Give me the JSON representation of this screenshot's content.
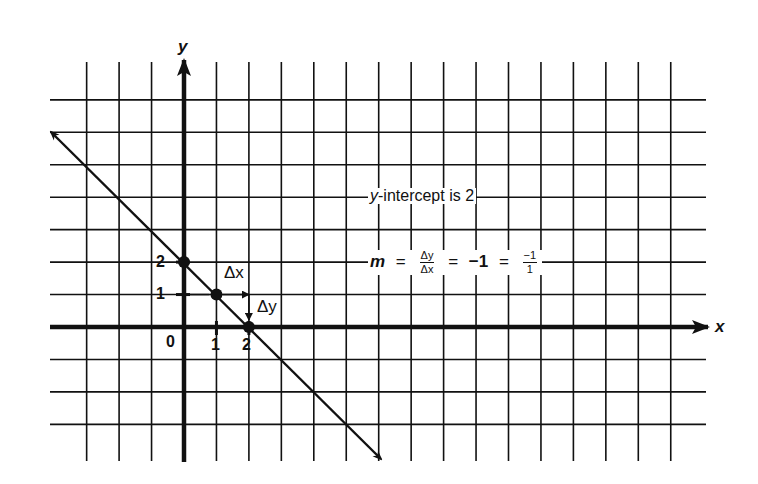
{
  "chart_data": {
    "type": "line",
    "title": "",
    "xlabel": "x",
    "ylabel": "y",
    "xlim": [
      -4,
      16
    ],
    "ylim": [
      -4,
      8
    ],
    "grid": true,
    "origin_label": "0",
    "x_tick_labels": [
      "1",
      "2"
    ],
    "y_tick_labels": [
      "1",
      "2"
    ],
    "series": [
      {
        "name": "y = -x + 2",
        "x": [
          -4,
          6
        ],
        "y": [
          6,
          -4
        ],
        "arrows": "both"
      }
    ],
    "points": [
      {
        "x": 0,
        "y": 2,
        "label": "y-intercept"
      },
      {
        "x": 1,
        "y": 1,
        "label": ""
      },
      {
        "x": 2,
        "y": 0,
        "label": "x-intercept"
      }
    ],
    "annotations": {
      "delta_x": "Δx",
      "delta_y": "Δy",
      "intercept_text_prefix": "y",
      "intercept_text_rest": "-intercept is 2",
      "slope": {
        "m": "m",
        "eq": "=",
        "frac1_num": "Δy",
        "frac1_den": "Δx",
        "value": "−1",
        "frac2_num": "−1",
        "frac2_den": "1"
      }
    },
    "slope": -1,
    "y_intercept": 2
  },
  "colors": {
    "ink": "#111111",
    "background": "#ffffff"
  }
}
